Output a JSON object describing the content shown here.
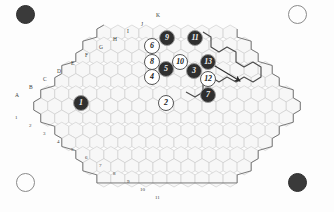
{
  "board": {
    "title": "hex-grid-board",
    "shape": "rhombus",
    "hex_fill": "#f7f7f7",
    "hex_stroke": "#c9c9c9",
    "outline_stroke": "#6b6b6b",
    "highlight_stroke": "#4a4a4a",
    "background": "#fdfdfd"
  },
  "corners": [
    {
      "name": "corner-top-left",
      "style": "filled",
      "x": 24,
      "y": 13,
      "size": 17
    },
    {
      "name": "corner-top-right",
      "style": "hollow",
      "x": 296,
      "y": 13,
      "size": 17
    },
    {
      "name": "corner-bottom-left",
      "style": "hollow",
      "x": 24,
      "y": 181,
      "size": 17
    },
    {
      "name": "corner-bottom-right",
      "style": "filled",
      "x": 296,
      "y": 181,
      "size": 17
    }
  ],
  "row_labels": [
    {
      "label": "A",
      "x": 15,
      "y": 93
    },
    {
      "label": "B",
      "x": 29,
      "y": 85
    },
    {
      "label": "C",
      "x": 43,
      "y": 77
    },
    {
      "label": "D",
      "x": 57,
      "y": 69
    },
    {
      "label": "E",
      "x": 71,
      "y": 61
    },
    {
      "label": "F",
      "x": 85,
      "y": 53
    },
    {
      "label": "G",
      "x": 99,
      "y": 45
    },
    {
      "label": "H",
      "x": 113,
      "y": 37
    },
    {
      "label": "I",
      "x": 127,
      "y": 29
    },
    {
      "label": "J",
      "x": 141,
      "y": 22
    },
    {
      "label": "K",
      "x": 156,
      "y": 13
    }
  ],
  "col_labels": [
    {
      "label": "1",
      "x": 15,
      "y": 115
    },
    {
      "label": "2",
      "x": 29,
      "y": 123
    },
    {
      "label": "3",
      "x": 43,
      "y": 131
    },
    {
      "label": "4",
      "x": 57,
      "y": 139
    },
    {
      "label": "5",
      "x": 71,
      "y": 147
    },
    {
      "label": "6",
      "x": 85,
      "y": 155
    },
    {
      "label": "7",
      "x": 99,
      "y": 163
    },
    {
      "label": "8",
      "x": 113,
      "y": 171
    },
    {
      "label": "9",
      "x": 127,
      "y": 179
    },
    {
      "label": "10",
      "x": 140,
      "y": 187
    },
    {
      "label": "11",
      "x": 155,
      "y": 195
    }
  ],
  "tokens": [
    {
      "label": "1",
      "style": "dark",
      "x": 81,
      "y": 103
    },
    {
      "label": "2",
      "style": "light",
      "x": 166,
      "y": 103
    },
    {
      "label": "3",
      "style": "dark",
      "x": 194,
      "y": 71
    },
    {
      "label": "4",
      "style": "light",
      "x": 152,
      "y": 77
    },
    {
      "label": "5",
      "style": "dark",
      "x": 166,
      "y": 69
    },
    {
      "label": "6",
      "style": "light",
      "x": 152,
      "y": 46
    },
    {
      "label": "7",
      "style": "dark",
      "x": 208,
      "y": 95
    },
    {
      "label": "8",
      "style": "light",
      "x": 152,
      "y": 62
    },
    {
      "label": "9",
      "style": "dark",
      "x": 167,
      "y": 38
    },
    {
      "label": "10",
      "style": "light",
      "x": 180,
      "y": 62
    },
    {
      "label": "11",
      "style": "dark",
      "x": 195,
      "y": 38
    },
    {
      "label": "12",
      "style": "light",
      "x": 208,
      "y": 79
    },
    {
      "label": "13",
      "style": "dark",
      "x": 208,
      "y": 62
    }
  ],
  "arrow": {
    "name": "move-arrow",
    "from_x": 205,
    "from_y": 60,
    "to_x": 240,
    "to_y": 81,
    "color": "#2b2b2b"
  }
}
